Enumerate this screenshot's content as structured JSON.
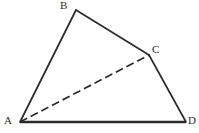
{
  "figure": {
    "kind": "geometry-diagram",
    "background_color": "#ffffff",
    "stroke_color": "#2b2b2b",
    "canvas": {
      "width": 199,
      "height": 133
    },
    "vertices": [
      {
        "id": "A",
        "label": "A",
        "x": 20,
        "y": 122,
        "label_x": 4,
        "label_y": 115
      },
      {
        "id": "B",
        "label": "B",
        "x": 76,
        "y": 10,
        "label_x": 60,
        "label_y": 0
      },
      {
        "id": "C",
        "label": "C",
        "x": 149,
        "y": 55,
        "label_x": 152,
        "label_y": 44
      },
      {
        "id": "D",
        "label": "D",
        "x": 186,
        "y": 122,
        "label_x": 188,
        "label_y": 115
      }
    ],
    "edges": [
      {
        "id": "AB",
        "from": "A",
        "to": "B",
        "style": "solid",
        "width": 1.7
      },
      {
        "id": "BC",
        "from": "B",
        "to": "C",
        "style": "solid",
        "width": 1.7
      },
      {
        "id": "CD",
        "from": "C",
        "to": "D",
        "style": "solid",
        "width": 1.7
      },
      {
        "id": "AD",
        "from": "A",
        "to": "D",
        "style": "solid",
        "width": 2.6
      },
      {
        "id": "AC",
        "from": "A",
        "to": "C",
        "style": "dashed",
        "width": 1.7,
        "dash": "8 4"
      }
    ]
  }
}
